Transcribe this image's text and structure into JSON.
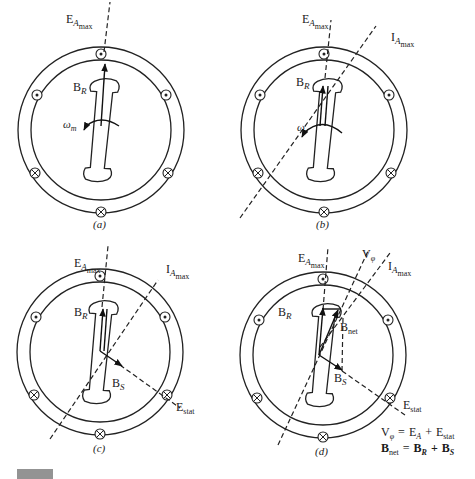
{
  "figure": {
    "caption_fragment": "FIGURE",
    "panels": [
      {
        "id": "a",
        "label": "(a)",
        "field_label": "B",
        "field_sub": "R",
        "speed_label": "ω",
        "speed_sub": "m",
        "ea_label": "E",
        "ea_sub": "A",
        "ea_subsub": "max"
      },
      {
        "id": "b",
        "label": "(b)",
        "field_label": "B",
        "field_sub": "R",
        "speed_label": "ω",
        "ea_label": "E",
        "ea_sub": "A",
        "ea_subsub": "max",
        "ia_label": "I",
        "ia_sub": "A",
        "ia_subsub": "max"
      },
      {
        "id": "c",
        "label": "(c)",
        "field_label": "B",
        "field_sub": "R",
        "stator_field_label": "B",
        "stator_field_sub": "S",
        "ea_label": "E",
        "ea_sub": "A",
        "ea_subsub": "max",
        "ia_label": "I",
        "ia_sub": "A",
        "ia_subsub": "max",
        "estat_label": "E",
        "estat_sub": "stat"
      },
      {
        "id": "d",
        "label": "(d)",
        "field_label": "B",
        "field_sub": "R",
        "stator_field_label": "B",
        "stator_field_sub": "S",
        "net_field_label": "B",
        "net_field_sub": "net",
        "vphi_label": "V",
        "vphi_sub": "φ",
        "ea_label": "E",
        "ea_sub": "A",
        "ea_subsub": "max",
        "ia_label": "I",
        "ia_sub": "A",
        "ia_subsub": "max",
        "estat_label": "E",
        "estat_sub": "stat",
        "equation1": {
          "lhs": "V",
          "lhs_sub": "φ",
          "eq": "=",
          "t1": "E",
          "t1_sub": "A",
          "plus": "+",
          "t2": "E",
          "t2_sub": "stat"
        },
        "equation2": {
          "lhs": "B",
          "lhs_sub": "net",
          "eq": "=",
          "t1": "B",
          "t1_sub": "R",
          "plus": "+",
          "t2": "B",
          "t2_sub": "S"
        }
      }
    ],
    "conductor_symbols": {
      "out_of_page": "dot-in-circle",
      "into_page": "cross-in-circle"
    },
    "colors": {
      "line": "#222222",
      "background": "#ffffff"
    }
  }
}
